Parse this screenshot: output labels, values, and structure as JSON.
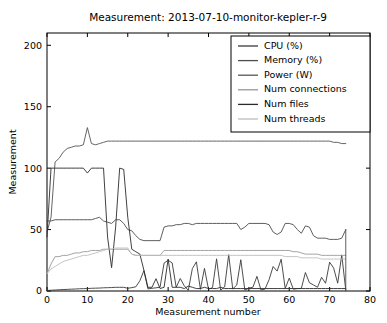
{
  "figure": {
    "width": 387,
    "height": 323,
    "background": "#ffffff"
  },
  "chart_data": {
    "type": "line",
    "title": "Measurement: 2013-07-10-monitor-kepler-r-9",
    "xlabel": "Measurement number",
    "ylabel": "Measurement",
    "xlim": [
      0,
      80
    ],
    "ylim": [
      0,
      210
    ],
    "xticks": [
      0,
      10,
      20,
      30,
      40,
      50,
      60,
      70,
      80
    ],
    "xticklabels": [
      "0",
      "10",
      "20",
      "30",
      "40",
      "50",
      "60",
      "70",
      "80"
    ],
    "yticks": [
      0,
      50,
      100,
      150,
      200
    ],
    "yticklabels": [
      "0",
      "50",
      "100",
      "150",
      "200"
    ],
    "grid": false,
    "legend_position": "upper right",
    "series": [
      {
        "name": "CPU (%)",
        "color": "#3a3a3a",
        "x": [
          0,
          1,
          2,
          3,
          4,
          5,
          6,
          7,
          8,
          9,
          10,
          11,
          12,
          13,
          14,
          15,
          16,
          17,
          18,
          19,
          20,
          21,
          22,
          23,
          24,
          25,
          26,
          27,
          28,
          29,
          30,
          31,
          32,
          33,
          34,
          35,
          36,
          37,
          38,
          39,
          40,
          41,
          42,
          43,
          44,
          45,
          46,
          47,
          48,
          49,
          50,
          51,
          52,
          53,
          54,
          55,
          56,
          57,
          58,
          59,
          60,
          61,
          62,
          63,
          64,
          65,
          66,
          67,
          68,
          69,
          70,
          71,
          72,
          73,
          74
        ],
        "values": [
          0.5,
          0.6,
          0.8,
          1.0,
          1.2,
          1.3,
          1.5,
          1.6,
          1.8,
          1.9,
          2.0,
          2.2,
          2.3,
          2.4,
          2.6,
          2.7,
          2.8,
          3.0,
          3.1,
          3.2,
          3.3,
          3.4,
          3.5,
          3.6,
          3.7,
          3.7,
          3.8,
          3.9,
          4.0,
          4.0,
          4.1,
          4.2,
          4.2,
          4.3,
          4.3,
          4.4,
          4.4,
          4.5,
          4.5,
          4.6,
          4.6,
          4.7,
          4.7,
          4.8,
          4.8,
          4.8,
          4.9,
          4.9,
          5.0,
          5.0,
          5.0,
          5.1,
          5.1,
          5.1,
          5.2,
          5.2,
          5.2,
          5.3,
          5.3,
          5.3,
          5.4,
          5.4,
          5.4,
          5.5,
          5.5,
          5.5,
          5.6,
          5.6,
          5.6,
          5.6,
          5.7,
          5.7,
          5.7,
          5.8,
          0.0
        ]
      },
      {
        "name": "Memory (%)",
        "color": "#4d4d4d",
        "x": [
          0,
          1,
          2,
          3,
          4,
          5,
          6,
          7,
          8,
          9,
          10,
          11,
          12,
          13,
          14,
          15,
          16,
          17,
          18,
          19,
          20,
          21,
          22,
          23,
          24,
          25,
          26,
          27,
          28,
          29,
          30,
          31,
          32,
          33,
          34,
          35,
          36,
          37,
          38,
          39,
          40,
          41,
          42,
          43,
          44,
          45,
          46,
          47,
          48,
          49,
          50,
          51,
          52,
          53,
          54,
          55,
          56,
          57,
          58,
          59,
          60,
          61,
          62,
          63,
          64,
          65,
          66,
          67,
          68,
          69,
          70,
          71,
          72,
          73,
          74
        ],
        "values": [
          57,
          57,
          58,
          58,
          58,
          58,
          58,
          58,
          58,
          58,
          58,
          58,
          59,
          60,
          57,
          56,
          55,
          58,
          58,
          55,
          50,
          49,
          45,
          42,
          41,
          41,
          41,
          41,
          41,
          52,
          53,
          53,
          54,
          54,
          55,
          55,
          54,
          55,
          55,
          55,
          55,
          55,
          55,
          55,
          55,
          55,
          55,
          55,
          50,
          52,
          55,
          55,
          55,
          55,
          55,
          54,
          48,
          46,
          48,
          55,
          55,
          54,
          50,
          47,
          53,
          52,
          45,
          43,
          43,
          43,
          42,
          42,
          42,
          43,
          50
        ]
      },
      {
        "name": "Power (W)",
        "color": "#555555",
        "x": [
          0,
          1,
          2,
          3,
          4,
          5,
          6,
          7,
          8,
          9,
          10,
          11,
          12,
          13,
          14,
          15,
          16,
          17,
          18,
          19,
          20,
          21,
          22,
          23,
          24,
          25,
          26,
          27,
          28,
          29,
          30,
          31,
          32,
          33,
          34,
          35,
          36,
          37,
          38,
          39,
          40,
          41,
          42,
          43,
          44,
          45,
          46,
          47,
          48,
          49,
          50,
          51,
          52,
          53,
          54,
          55,
          56,
          57,
          58,
          59,
          60,
          61,
          62,
          63,
          64,
          65,
          66,
          67,
          68,
          69,
          70,
          71,
          72,
          73,
          74
        ],
        "values": [
          48,
          60,
          105,
          108,
          113,
          116,
          117,
          118,
          118,
          119,
          133,
          120,
          119,
          120,
          121,
          122,
          122,
          122,
          122,
          122,
          122,
          122,
          122,
          122,
          122,
          122,
          122,
          122,
          122,
          122,
          122,
          122,
          122,
          122,
          122,
          122,
          122,
          122,
          122,
          122,
          122,
          122,
          122,
          122,
          122,
          122,
          122,
          122,
          122,
          122,
          122,
          122,
          122,
          122,
          122,
          122,
          122,
          122,
          122,
          122,
          122,
          122,
          122,
          122,
          122,
          122,
          122,
          122,
          122,
          122,
          122,
          121,
          121,
          120,
          120
        ]
      },
      {
        "name": "Num connections",
        "color": "#989898",
        "x": [
          0,
          1,
          2,
          3,
          4,
          5,
          6,
          7,
          8,
          9,
          10,
          11,
          12,
          13,
          14,
          15,
          16,
          17,
          18,
          19,
          20,
          21,
          22,
          23,
          24,
          25,
          26,
          27,
          28,
          29,
          30,
          31,
          32,
          33,
          34,
          35,
          36,
          37,
          38,
          39,
          40,
          41,
          42,
          43,
          44,
          45,
          46,
          47,
          48,
          49,
          50,
          51,
          52,
          53,
          54,
          55,
          56,
          57,
          58,
          59,
          60,
          61,
          62,
          63,
          64,
          65,
          66,
          67,
          68,
          69,
          70,
          71,
          72,
          73,
          74
        ],
        "values": [
          14,
          22,
          28,
          28,
          29,
          29,
          30,
          31,
          31,
          32,
          32,
          33,
          33,
          33,
          34,
          34,
          34,
          34,
          34,
          34,
          34,
          30,
          29,
          29,
          29,
          29,
          29,
          29,
          29,
          33,
          33,
          33,
          33,
          33,
          33,
          33,
          33,
          33,
          33,
          33,
          33,
          33,
          33,
          33,
          33,
          33,
          33,
          33,
          33,
          33,
          33,
          33,
          33,
          33,
          33,
          33,
          33,
          33,
          33,
          33,
          33,
          32,
          32,
          31,
          30,
          30,
          30,
          30,
          29,
          29,
          29,
          29,
          29,
          29,
          29
        ]
      },
      {
        "name": "Num files",
        "color": "#2b2b2b",
        "x": [
          0,
          1,
          2,
          3,
          4,
          5,
          6,
          7,
          8,
          9,
          10,
          11,
          12,
          13,
          14,
          15,
          16,
          17,
          18,
          19,
          20,
          21,
          22,
          23,
          24,
          25,
          26,
          27,
          28,
          29,
          30,
          31,
          32,
          33,
          34,
          35,
          36,
          37,
          38,
          39,
          40,
          41,
          42,
          43,
          44,
          45,
          46,
          47,
          48,
          49,
          50,
          51,
          52,
          53,
          54,
          55,
          56,
          57,
          58,
          59,
          60,
          61,
          62,
          63,
          64,
          65,
          66,
          67,
          68,
          69,
          70,
          71,
          72,
          73,
          74
        ],
        "values": [
          44,
          100,
          100,
          100,
          100,
          100,
          100,
          100,
          100,
          100,
          96,
          100,
          100,
          100,
          100,
          44,
          19,
          52,
          100,
          99,
          60,
          34,
          32,
          30,
          17,
          3,
          3,
          10,
          2,
          3,
          26,
          3,
          3,
          3,
          2,
          4,
          3,
          2,
          2,
          3,
          2,
          2,
          2,
          3,
          2,
          2,
          2,
          2,
          2,
          2,
          2,
          2,
          2,
          2,
          2,
          2,
          2,
          2,
          2,
          2,
          2,
          2,
          2,
          2,
          2,
          2,
          2,
          2,
          2,
          2,
          2,
          2,
          2,
          2,
          2
        ]
      },
      {
        "name": "Num threads",
        "color": "#bdbdbd",
        "x": [
          0,
          1,
          2,
          3,
          4,
          5,
          6,
          7,
          8,
          9,
          10,
          11,
          12,
          13,
          14,
          15,
          16,
          17,
          18,
          19,
          20,
          21,
          22,
          23,
          24,
          25,
          26,
          27,
          28,
          29,
          30,
          31,
          32,
          33,
          34,
          35,
          36,
          37,
          38,
          39,
          40,
          41,
          42,
          43,
          44,
          45,
          46,
          47,
          48,
          49,
          50,
          51,
          52,
          53,
          54,
          55,
          56,
          57,
          58,
          59,
          60,
          61,
          62,
          63,
          64,
          65,
          66,
          67,
          68,
          69,
          70,
          71,
          72,
          73,
          74
        ],
        "values": [
          14,
          18,
          20,
          22,
          24,
          25,
          26,
          27,
          28,
          29,
          29,
          30,
          31,
          32,
          33,
          34,
          34,
          35,
          35,
          35,
          35,
          30,
          29,
          29,
          29,
          29,
          29,
          29,
          29,
          29,
          29,
          29,
          29,
          29,
          29,
          29,
          29,
          29,
          29,
          29,
          29,
          29,
          29,
          29,
          29,
          29,
          29,
          29,
          29,
          29,
          29,
          29,
          29,
          29,
          29,
          29,
          29,
          29,
          29,
          28,
          28,
          28,
          28,
          27,
          27,
          27,
          27,
          27,
          26,
          26,
          26,
          26,
          26,
          26,
          26
        ]
      }
    ],
    "spikes_note": "CPU series includes sharp transient spikes"
  },
  "axes": {
    "plot_left": 47,
    "plot_right": 370,
    "plot_top": 33,
    "plot_bottom": 291
  },
  "title_text": "Measurement: 2013-07-10-monitor-kepler-r-9",
  "ylabel_text": "Measurement",
  "xlabel_text": "Measurement number"
}
